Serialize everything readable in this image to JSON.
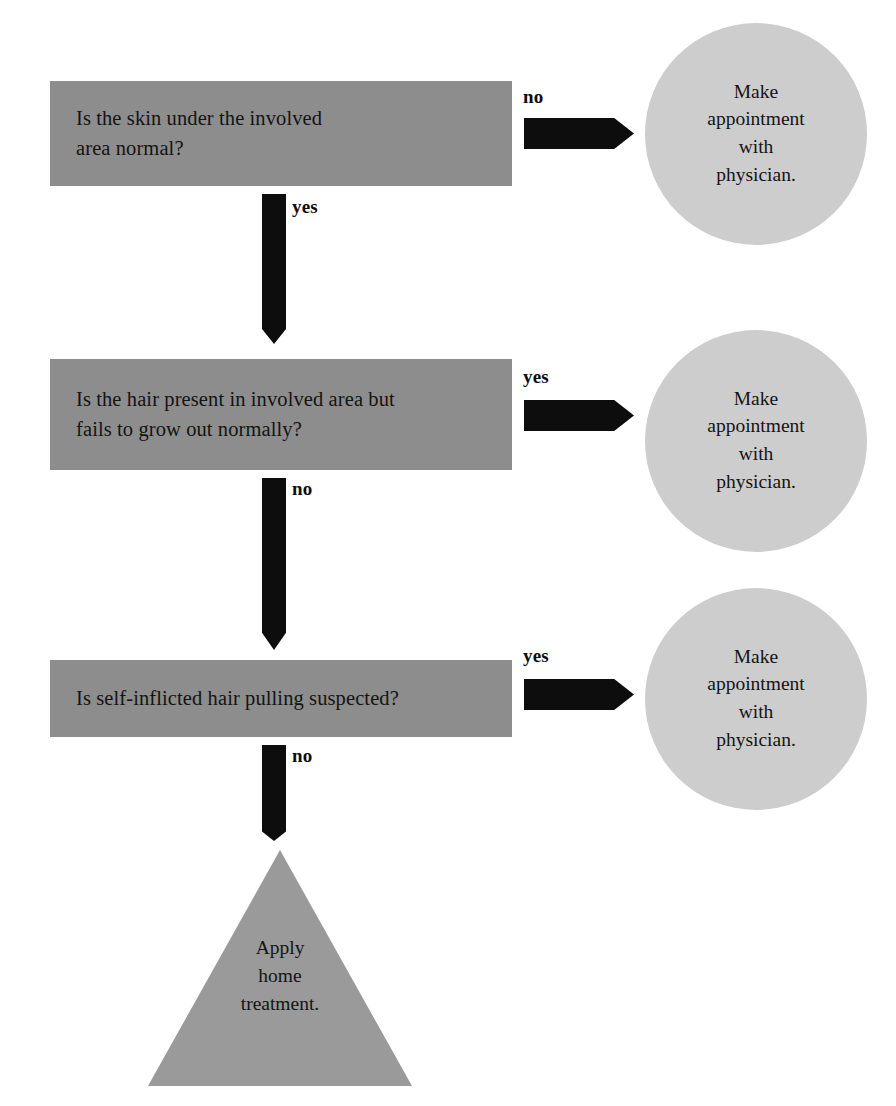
{
  "diagram": {
    "colors": {
      "box_fill": "#8d8d8d",
      "circle_fill": "#cdcdcd",
      "triangle_fill": "#9a9a9a",
      "arrow_fill": "#0d0d0d",
      "text": "#141414",
      "background": "#ffffff"
    },
    "decisions": [
      {
        "id": "decision-1",
        "text": "Is the skin under the involved\narea normal?",
        "no_label": "no",
        "yes_label": "yes"
      },
      {
        "id": "decision-2",
        "text": "Is the hair present in involved area but\nfails to grow out normally?",
        "yes_label": "yes",
        "no_label": "no"
      },
      {
        "id": "decision-3",
        "text": "Is self-inflicted hair pulling suspected?",
        "yes_label": "yes",
        "no_label": "no"
      }
    ],
    "outcomes": [
      {
        "id": "outcome-1",
        "text": "Make\nappointment\nwith\nphysician."
      },
      {
        "id": "outcome-2",
        "text": "Make\nappointment\nwith\nphysician."
      },
      {
        "id": "outcome-3",
        "text": "Make\nappointment\nwith\nphysician."
      }
    ],
    "terminal": {
      "id": "terminal-1",
      "text": "Apply\nhome\ntreatment."
    },
    "edges": {
      "no_1": "no",
      "yes_1": "yes",
      "yes_2": "yes",
      "no_2": "no",
      "yes_3": "yes",
      "no_3": "no"
    }
  }
}
